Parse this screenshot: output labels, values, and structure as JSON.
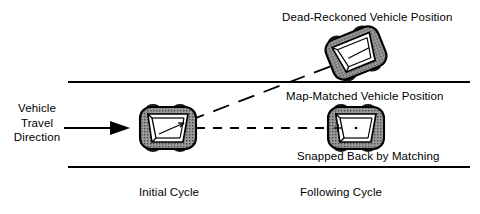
{
  "diagram": {
    "type": "map-matching-illustration",
    "background_color": "#ffffff",
    "line_color": "#000000",
    "vehicle_fill_color": "#8c8c8c",
    "vehicle_outline_color": "#000000",
    "vehicle_inner_color": "#ffffff",
    "wheel_color": "#1a1a1a"
  },
  "labels": {
    "dead_reckoned": "Dead-Reckoned Vehicle Position",
    "map_matched": "Map-Matched Vehicle Position",
    "snapped_back": "Snapped Back by Matching",
    "initial_cycle": "Initial Cycle",
    "following_cycle": "Following Cycle",
    "travel_direction_line1": "Vehicle",
    "travel_direction_line2": "Travel",
    "travel_direction_line3": "Direction"
  },
  "road": {
    "upper_line": {
      "x1": 68,
      "y1": 82,
      "x2": 470,
      "y2": 82
    },
    "lower_line": {
      "x1": 68,
      "y1": 167,
      "x2": 470,
      "y2": 167
    }
  },
  "arrow": {
    "shaft": {
      "x1": 64,
      "y1": 128,
      "x2": 112,
      "y2": 128
    },
    "head_tip_x": 130,
    "head_back_x": 110,
    "head_half_height": 7
  },
  "dashed_path_horizontal": {
    "x1": 196,
    "y1": 128,
    "x2": 330,
    "y2": 128,
    "dash": "9,8"
  },
  "dashed_path_diagonal": {
    "x1": 188,
    "y1": 120,
    "x2": 330,
    "y2": 66,
    "dash": "16,9"
  },
  "vehicles": [
    {
      "name": "initial-cycle-vehicle",
      "cx": 168,
      "cy": 128,
      "width": 56,
      "height": 42,
      "rotation_deg": 0
    },
    {
      "name": "dead-reckoned-vehicle",
      "cx": 356,
      "cy": 53,
      "width": 56,
      "height": 42,
      "rotation_deg": -22
    },
    {
      "name": "map-matched-vehicle",
      "cx": 356,
      "cy": 128,
      "width": 56,
      "height": 42,
      "rotation_deg": 0
    }
  ]
}
